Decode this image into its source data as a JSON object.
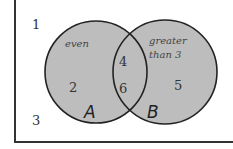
{
  "diagram": {
    "type": "venn",
    "universe_outside": [
      "1",
      "3"
    ],
    "sets": [
      {
        "name": "A",
        "label": "A",
        "description": "even",
        "only": [
          "2"
        ]
      },
      {
        "name": "B",
        "label": "B",
        "description_line1": "greater",
        "description_line2": "than 3",
        "only": [
          "5"
        ]
      }
    ],
    "intersection": [
      "4",
      "6"
    ],
    "colors": {
      "fill": "#bdbdbd",
      "stroke": "#222222",
      "text": "#333333"
    }
  }
}
